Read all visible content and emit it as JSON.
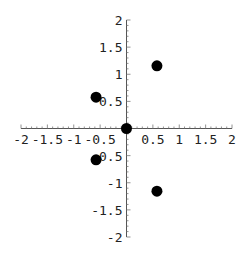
{
  "chart_data": {
    "type": "scatter",
    "title": "",
    "xlabel": "",
    "ylabel": "",
    "xlim": [
      -2,
      2
    ],
    "ylim": [
      -2,
      2
    ],
    "grid": false,
    "legend": null,
    "axes_origin": [
      0,
      0
    ],
    "x_ticks": [
      "-2",
      "-1.5",
      "-1",
      "-0.5",
      "0.5",
      "1",
      "1.5",
      "2"
    ],
    "x_tick_values": [
      -2,
      -1.5,
      -1,
      -0.5,
      0.5,
      1,
      1.5,
      2
    ],
    "y_ticks": [
      "2",
      "1.5",
      "1",
      "0.5",
      "-0.5",
      "-1",
      "-1.5",
      "-2"
    ],
    "y_tick_values": [
      2,
      1.5,
      1,
      0.5,
      -0.5,
      -1,
      -1.5,
      -2
    ],
    "series": [
      {
        "name": "points",
        "color": "#000000",
        "marker": "filled-circle",
        "points": [
          {
            "x": 0,
            "y": 0
          },
          {
            "x": -0.577,
            "y": 0.577
          },
          {
            "x": 0.577,
            "y": 1.155
          },
          {
            "x": -0.577,
            "y": -0.577
          },
          {
            "x": 0.577,
            "y": -1.155
          }
        ]
      }
    ]
  }
}
